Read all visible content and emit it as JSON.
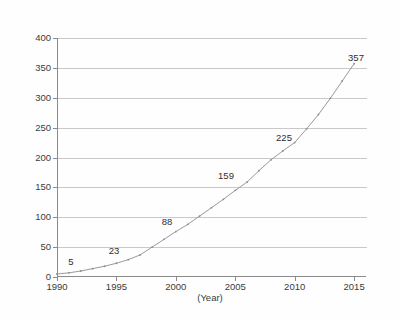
{
  "chart_data": {
    "type": "line",
    "title": "",
    "xlabel": "(Year)",
    "ylabel": "",
    "xlim": [
      1990,
      2016
    ],
    "ylim": [
      0,
      400
    ],
    "grid": true,
    "legend": "none",
    "x_ticks": [
      "1990",
      "1995",
      "2000",
      "2005",
      "2010",
      "2015"
    ],
    "x_tick_values": [
      1990,
      1995,
      2000,
      2005,
      2010,
      2015
    ],
    "y_ticks": [
      "0",
      "50",
      "100",
      "150",
      "200",
      "250",
      "300",
      "350",
      "400"
    ],
    "y_tick_values": [
      0,
      50,
      100,
      150,
      200,
      250,
      300,
      350,
      400
    ],
    "series": [
      {
        "name": "series-1",
        "color": "#8d8d8d",
        "marker": "dot",
        "x": [
          1990,
          1991,
          1992,
          1993,
          1994,
          1995,
          1996,
          1997,
          1998,
          1999,
          2000,
          2001,
          2002,
          2003,
          2004,
          2005,
          2006,
          2007,
          2008,
          2009,
          2010,
          2011,
          2012,
          2013,
          2014,
          2015
        ],
        "values": [
          5,
          7,
          10,
          14,
          18,
          23,
          29,
          37,
          50,
          63,
          76,
          88,
          102,
          116,
          130,
          145,
          159,
          178,
          196,
          211,
          225,
          248,
          272,
          299,
          328,
          357
        ]
      }
    ],
    "point_labels": [
      {
        "text": "5",
        "x": 1990,
        "y": 5,
        "px": 71,
        "py": 262
      },
      {
        "text": "23",
        "x": 1995,
        "y": 23,
        "px": 114,
        "py": 251
      },
      {
        "text": "88",
        "x": 2001,
        "y": 88,
        "px": 167,
        "py": 222
      },
      {
        "text": "159",
        "x": 2006,
        "y": 159,
        "px": 226,
        "py": 176
      },
      {
        "text": "225",
        "x": 2010,
        "y": 225,
        "px": 284,
        "py": 138
      },
      {
        "text": "357",
        "x": 2015,
        "y": 357,
        "px": 356,
        "py": 58
      }
    ],
    "colors": {
      "line": "#8d8d8d",
      "grid": "#c9c9c9",
      "axis": "#8a8a8a",
      "text": "#3b3b3b",
      "background": "#fefefe"
    }
  }
}
